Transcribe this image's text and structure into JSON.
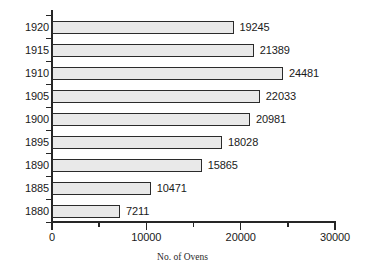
{
  "chart_data": {
    "type": "bar",
    "orientation": "horizontal",
    "title": "",
    "xlabel": "No. of Ovens",
    "ylabel": "",
    "categories": [
      "1880",
      "1885",
      "1890",
      "1895",
      "1900",
      "1905",
      "1910",
      "1915",
      "1920"
    ],
    "values": [
      7211,
      10471,
      15865,
      18028,
      20981,
      22033,
      24481,
      21389,
      19245
    ],
    "value_labels": [
      "7211",
      "10471",
      "15865",
      "18028",
      "20981",
      "22033",
      "24481",
      "21389",
      "19245"
    ],
    "xlim": [
      0,
      30000
    ],
    "x_ticks_major": [
      0,
      10000,
      20000,
      30000
    ],
    "x_tick_labels": [
      "0",
      "10000",
      "20000",
      "30000"
    ],
    "x_ticks_minor": [
      5000,
      15000,
      25000
    ],
    "grid": false,
    "legend": false,
    "colors": {
      "bar_fill": "#e9e9e9",
      "bar_border": "#2b2b2b",
      "axis": "#262626",
      "text": "#1a1a1a",
      "background": "#ffffff"
    }
  }
}
